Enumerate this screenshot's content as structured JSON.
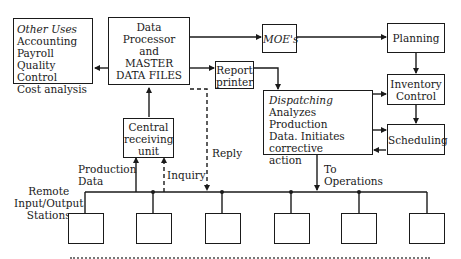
{
  "diagram": {
    "other_uses": {
      "title": "Other Uses",
      "items": [
        "Accounting",
        "Payroll",
        "Quality Control",
        "Cost analysis"
      ]
    },
    "data_processor": {
      "lines": [
        "Data",
        "Processor",
        "and",
        "MASTER",
        "DATA FILES"
      ]
    },
    "moes": {
      "label": "MOE's"
    },
    "planning": {
      "label": "Planning"
    },
    "report_printer": {
      "lines": [
        "Report",
        "printer"
      ]
    },
    "inventory_control": {
      "lines": [
        "Inventory",
        "Control"
      ]
    },
    "dispatching": {
      "title": "Dispatching",
      "lines": [
        "Analyzes Production",
        "Data. Initiates",
        "corrective",
        "action"
      ]
    },
    "scheduling": {
      "label": "Scheduling"
    },
    "central_receiving": {
      "lines": [
        "Central",
        "receiving",
        "unit"
      ]
    },
    "labels": {
      "reply": "Reply",
      "inquiry": "Inquiry",
      "production_data": [
        "Production",
        "Data"
      ],
      "to_operations": [
        "To",
        "Operations"
      ],
      "remote_stations": [
        "Remote",
        "Input/Output",
        "Stations"
      ]
    },
    "station_count": 6
  }
}
